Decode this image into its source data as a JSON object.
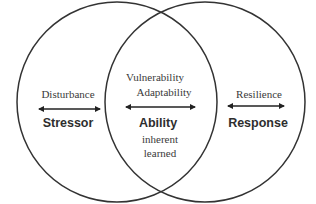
{
  "diagram": {
    "type": "venn",
    "left_circle": {
      "top_label": "Disturbance",
      "main_label": "Stressor"
    },
    "intersection": {
      "top_labels": [
        "Vulnerability",
        "Adaptability"
      ],
      "main_label": "Ability",
      "sub_labels": [
        "inherent",
        "learned"
      ]
    },
    "right_circle": {
      "top_label": "Resilience",
      "main_label": "Response"
    },
    "arrows": [
      "double-headed",
      "double-headed",
      "double-headed"
    ],
    "colors": {
      "stroke": "#333333",
      "text": "#3a3a3a"
    }
  }
}
